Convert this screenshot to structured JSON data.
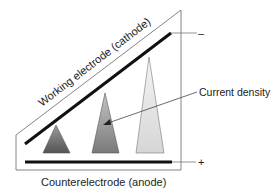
{
  "diagram": {
    "labels": {
      "cathode": "Working electrode (cathode)",
      "anode": "Counterelectrode (anode)",
      "current_density": "Current density",
      "cathode_terminal": "–",
      "anode_terminal": "+"
    },
    "triangles": [
      {
        "name": "small",
        "shade": "dark"
      },
      {
        "name": "medium",
        "shade": "medium"
      },
      {
        "name": "large",
        "shade": "light"
      }
    ],
    "colors": {
      "outline": "#555555",
      "electrode": "#111111",
      "dark": "#6a6a6a",
      "medium": "#9a9a9a",
      "light": "#dedede"
    }
  }
}
